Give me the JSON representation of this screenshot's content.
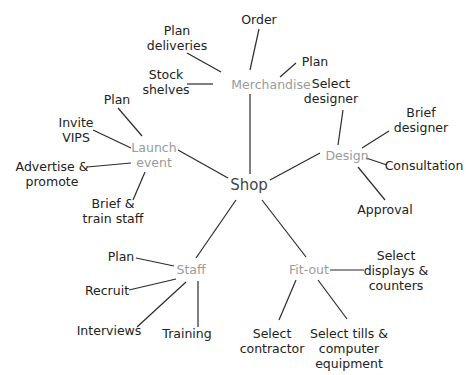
{
  "colors": {
    "leaf_text": "#222222",
    "branch_text": "#9a9a9a",
    "root_text": "#444444",
    "line": "#2b2b2b",
    "background": "#ffffff"
  },
  "root": {
    "label": "Shop",
    "x": 249,
    "y": 185
  },
  "branches": [
    {
      "id": "merchandise",
      "label": "Merchandise",
      "x": 271,
      "y": 84,
      "children": [
        {
          "label": "Order",
          "x": 259,
          "y": 21
        },
        {
          "label": "Plan",
          "x": 314,
          "y": 62
        },
        {
          "label": "Plan deliveries",
          "x": 178,
          "y": 37
        },
        {
          "label": "Stock shelves",
          "x": 166,
          "y": 82
        }
      ]
    },
    {
      "id": "design",
      "label": "Design",
      "x": 347,
      "y": 155,
      "children": [
        {
          "label": "Select designer",
          "x": 331,
          "y": 91
        },
        {
          "label": "Brief designer",
          "x": 421,
          "y": 121
        },
        {
          "label": "Consultation",
          "x": 422,
          "y": 165
        },
        {
          "label": "Approval",
          "x": 385,
          "y": 209
        }
      ]
    },
    {
      "id": "launch-event",
      "label": "Launch event",
      "x": 154,
      "y": 155,
      "children": [
        {
          "label": "Plan",
          "x": 118,
          "y": 99
        },
        {
          "label": "Invite VIPS",
          "x": 76,
          "y": 130
        },
        {
          "label": "Advertise & promote",
          "x": 52,
          "y": 174
        },
        {
          "label": "Brief & train staff",
          "x": 113,
          "y": 210
        }
      ]
    },
    {
      "id": "staff",
      "label": "Staff",
      "x": 191,
      "y": 269,
      "children": [
        {
          "label": "Plan",
          "x": 121,
          "y": 256
        },
        {
          "label": "Recruit",
          "x": 107,
          "y": 290
        },
        {
          "label": "Interviews",
          "x": 109,
          "y": 330
        },
        {
          "label": "Training",
          "x": 187,
          "y": 333
        }
      ]
    },
    {
      "id": "fit-out",
      "label": "Fit-out",
      "x": 309,
      "y": 269,
      "children": [
        {
          "label": "Select displays & counters",
          "x": 395,
          "y": 270
        },
        {
          "label": "Select contractor",
          "x": 272,
          "y": 341
        },
        {
          "label": "Select tills & computer equipment",
          "x": 349,
          "y": 348
        }
      ]
    }
  ],
  "labels": {
    "root": "Shop",
    "merchandise": "Merchandise",
    "m_order": "Order",
    "m_plan": "Plan",
    "m_plan_deliveries_1": "Plan",
    "m_plan_deliveries_2": "deliveries",
    "m_stock_1": "Stock",
    "m_stock_2": "shelves",
    "design": "Design",
    "d_select_1": "Select",
    "d_select_2": "designer",
    "d_brief_1": "Brief",
    "d_brief_2": "designer",
    "d_consult": "Consultation",
    "d_approval": "Approval",
    "launch_1": "Launch",
    "launch_2": "event",
    "l_plan": "Plan",
    "l_invite_1": "Invite",
    "l_invite_2": "VIPS",
    "l_adv_1": "Advertise &",
    "l_adv_2": "promote",
    "l_brief_1": "Brief &",
    "l_brief_2": "train staff",
    "staff": "Staff",
    "s_plan": "Plan",
    "s_recruit": "Recruit",
    "s_interviews": "Interviews",
    "s_training": "Training",
    "fitout": "Fit-out",
    "f_displays_1": "Select",
    "f_displays_2": "displays &",
    "f_displays_3": "counters",
    "f_contractor_1": "Select",
    "f_contractor_2": "contractor",
    "f_tills_1": "Select tills &",
    "f_tills_2": "computer",
    "f_tills_3": "equipment"
  }
}
